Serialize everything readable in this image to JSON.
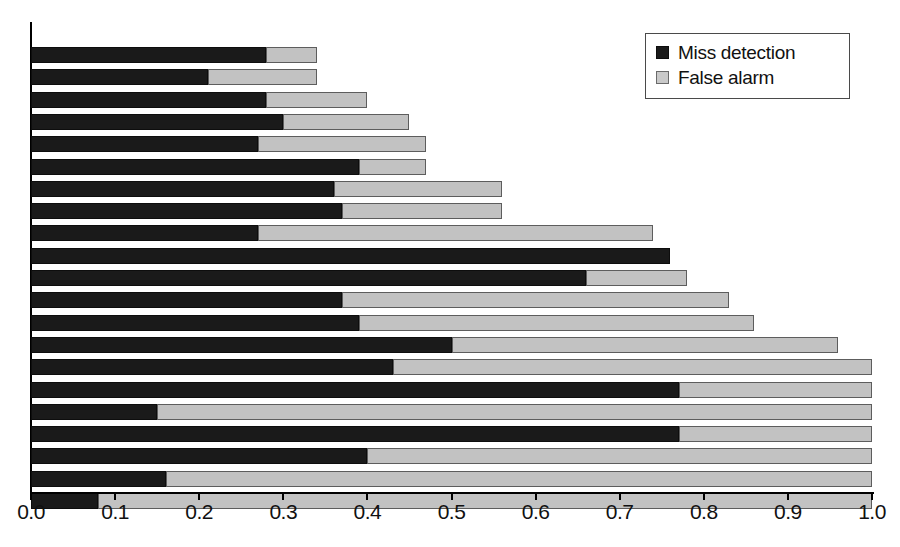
{
  "chart_data": {
    "type": "bar",
    "orientation": "horizontal",
    "stacked": true,
    "title": "",
    "xlabel": "",
    "ylabel": "",
    "xlim": [
      0.0,
      1.0
    ],
    "grid": false,
    "legend_position": "top-right",
    "tick_labels": [
      "0.0",
      "0.1",
      "0.2",
      "0.3",
      "0.4",
      "0.5",
      "0.6",
      "0.7",
      "0.8",
      "0.9",
      "1.0"
    ],
    "tick_values": [
      0.0,
      0.1,
      0.2,
      0.3,
      0.4,
      0.5,
      0.6,
      0.7,
      0.8,
      0.9,
      1.0
    ],
    "categories": [
      "1",
      "2",
      "3",
      "4",
      "5",
      "6",
      "7",
      "8",
      "9",
      "10",
      "11",
      "12",
      "13",
      "14",
      "15",
      "16",
      "17",
      "18",
      "19",
      "20",
      "21"
    ],
    "series": [
      {
        "name": "Miss detection",
        "color": "#1a1a1a",
        "values": [
          0.28,
          0.21,
          0.28,
          0.3,
          0.27,
          0.39,
          0.36,
          0.37,
          0.27,
          0.76,
          0.66,
          0.37,
          0.39,
          0.5,
          0.43,
          0.77,
          0.15,
          0.77,
          0.4,
          0.16,
          0.08
        ]
      },
      {
        "name": "False alarm",
        "color": "#c2c2c2",
        "values": [
          0.06,
          0.13,
          0.12,
          0.15,
          0.2,
          0.08,
          0.2,
          0.19,
          0.47,
          0.0,
          0.12,
          0.46,
          0.47,
          0.46,
          0.57,
          0.23,
          0.85,
          0.23,
          0.6,
          0.84,
          0.92
        ]
      }
    ],
    "totals": [
      0.34,
      0.34,
      0.4,
      0.45,
      0.47,
      0.47,
      0.56,
      0.56,
      0.74,
      0.76,
      0.78,
      0.83,
      0.86,
      0.96,
      1.0,
      1.0,
      1.0,
      1.0,
      1.0,
      1.0,
      1.0
    ]
  },
  "legend": {
    "items": [
      {
        "label": "Miss detection",
        "swatch": "dark-square-icon"
      },
      {
        "label": "False alarm",
        "swatch": "light-square-icon"
      }
    ]
  },
  "caption": ""
}
